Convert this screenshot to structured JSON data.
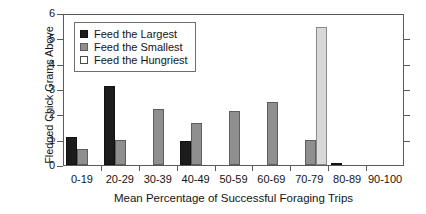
{
  "chart_data": {
    "type": "bar",
    "title": "",
    "xlabel": "Mean Percentage of Successful Foraging Trips",
    "ylabel_line1": "Fledged Chick Grams Above",
    "ylabel_line2": "Random Feeding",
    "categories": [
      "0-19",
      "20-29",
      "30-39",
      "40-49",
      "50-59",
      "60-69",
      "70-79",
      "80-89",
      "90-100"
    ],
    "series": [
      {
        "name": "Feed the Largest",
        "color": "#1c1c1c",
        "values": [
          1.1,
          3.1,
          0,
          0.95,
          0,
          0,
          0,
          0.05,
          0
        ]
      },
      {
        "name": "Feed the Smallest",
        "color": "#8f8f8f",
        "values": [
          0.63,
          1.0,
          2.2,
          1.66,
          2.15,
          2.5,
          1.0,
          0,
          0
        ]
      },
      {
        "name": "Feed the Hungriest",
        "color": "#d8d8d8",
        "values": [
          0,
          0,
          0,
          0,
          0,
          0,
          5.45,
          0,
          0
        ]
      }
    ],
    "ylim": [
      0,
      6
    ],
    "yticks": [
      0,
      1,
      2,
      3,
      4,
      5,
      6
    ],
    "ytick_labels": [
      "0",
      "1",
      "2",
      "3",
      "4",
      "5",
      "6"
    ],
    "grid": false,
    "legend_position": "upper-left-inside"
  }
}
